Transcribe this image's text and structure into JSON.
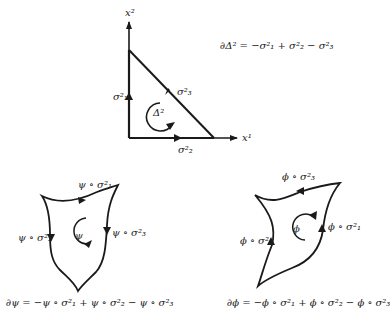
{
  "simplex": {
    "axis_y_label": "x²",
    "axis_x_label": "x¹",
    "center_label": "Δ²",
    "edge_left": "σ²₁",
    "edge_bottom": "σ²₂",
    "edge_hyp": "σ²₃",
    "boundary_eq": "∂Δ² = −σ²₁ + σ²₂ − σ²₃"
  },
  "psi": {
    "center_label": "ψ",
    "top_label": "ψ ∘ σ²₁",
    "left_label": "ψ ∘ σ²₂",
    "right_label": "ψ ∘ σ²₃",
    "boundary_eq": "∂ψ = −ψ ∘ σ²₁ + ψ ∘ σ²₂ − ψ ∘ σ²₃"
  },
  "phi": {
    "center_label": "ϕ",
    "top_label": "ϕ ∘ σ²₃",
    "left_label": "ϕ ∘ σ²₂",
    "right_label": "ϕ ∘ σ²₁",
    "boundary_eq": "∂ϕ = −ϕ ∘ σ²₁ + ϕ ∘ σ²₂ − ϕ ∘ σ²₃"
  },
  "colors": {
    "stroke": "#1a1a1a",
    "background": "#ffffff"
  }
}
